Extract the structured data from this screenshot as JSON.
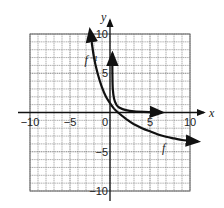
{
  "chart_data": {
    "type": "line",
    "title": "",
    "xlabel": "x",
    "ylabel": "y",
    "xlim": [
      -10,
      10
    ],
    "ylim": [
      -10,
      10
    ],
    "grid": true,
    "grid_step": 1,
    "x_ticks": [
      {
        "value": -10,
        "label": "−10"
      },
      {
        "value": -5,
        "label": "−5"
      },
      {
        "value": 0,
        "label": "0"
      },
      {
        "value": 5,
        "label": "5"
      },
      {
        "value": 10,
        "label": "10"
      }
    ],
    "y_ticks": [
      {
        "value": 10,
        "label": "10"
      },
      {
        "value": 5,
        "label": "5"
      },
      {
        "value": -5,
        "label": "−5"
      },
      {
        "value": -10,
        "label": "−10"
      }
    ],
    "series": [
      {
        "name": "f",
        "label": "f",
        "points": [
          [
            -2.5,
            10.5
          ],
          [
            -2,
            7
          ],
          [
            -1.5,
            4.8
          ],
          [
            -1,
            3.2
          ],
          [
            -0.5,
            2
          ],
          [
            0,
            1.2
          ],
          [
            0.5,
            0.5
          ],
          [
            1,
            0
          ],
          [
            2,
            -0.8
          ],
          [
            3,
            -1.5
          ],
          [
            4,
            -2
          ],
          [
            5,
            -2.4
          ],
          [
            6,
            -2.8
          ],
          [
            7,
            -3.1
          ],
          [
            8,
            -3.3
          ],
          [
            9,
            -3.5
          ],
          [
            10,
            -3.6
          ],
          [
            11,
            -3.7
          ]
        ]
      },
      {
        "name": "f_inverse",
        "label": "f⁻¹",
        "points": [
          [
            0.3,
            7.5
          ],
          [
            0.3,
            5
          ],
          [
            0.35,
            3
          ],
          [
            0.5,
            1.8
          ],
          [
            0.8,
            1
          ],
          [
            1.2,
            0.6
          ],
          [
            2,
            0.3
          ],
          [
            3,
            0.15
          ],
          [
            5,
            0.05
          ],
          [
            6.5,
            0
          ]
        ]
      }
    ],
    "annotations": [
      {
        "text": "f",
        "x": 6.5,
        "y": -5
      },
      {
        "text": "f⁻¹",
        "x": -3.2,
        "y": 6.2
      }
    ]
  }
}
